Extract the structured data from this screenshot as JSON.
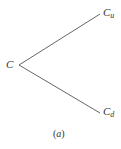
{
  "diagram": {
    "type": "binomial-tree-branch",
    "root": {
      "symbol": "C",
      "subscript": ""
    },
    "up_node": {
      "symbol": "C",
      "subscript": "u"
    },
    "down_node": {
      "symbol": "C",
      "subscript": "d"
    },
    "caption": {
      "open": "(",
      "letter": "a",
      "close": ")"
    },
    "line_color": "#555555",
    "text_color": "#333333"
  }
}
